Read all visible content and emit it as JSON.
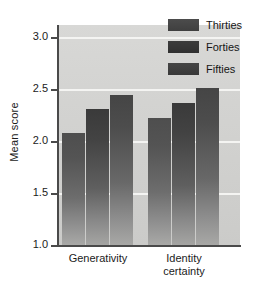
{
  "chart_data": {
    "type": "bar",
    "title": "",
    "xlabel": "",
    "ylabel": "Mean score",
    "categories": [
      "Generativity",
      "Identity certainty"
    ],
    "category_labels_multiline": [
      [
        "Generativity"
      ],
      [
        "Identity",
        "certainty"
      ]
    ],
    "series": [
      {
        "name": "Thirties",
        "values": [
          2.08,
          2.22
        ],
        "color": "#4e4e4e"
      },
      {
        "name": "Forties",
        "values": [
          2.31,
          2.37
        ],
        "color": "#3a3a3a"
      },
      {
        "name": "Fifties",
        "values": [
          2.45,
          2.51
        ],
        "color": "#454545"
      }
    ],
    "ylim": [
      1.0,
      3.12
    ],
    "yticks": [
      1.0,
      1.5,
      2.0,
      2.5,
      3.0
    ],
    "ytick_labels": [
      "1.0",
      "1.5",
      "2.0",
      "2.5",
      "3.0"
    ],
    "grid": true,
    "gridline_color": "#f4f4f2",
    "legend_position": "top-right",
    "plot_background": "#d4d4d2"
  }
}
